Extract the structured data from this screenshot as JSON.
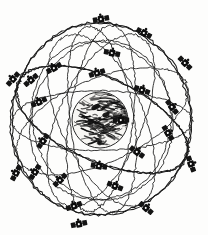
{
  "figure": {
    "kind": "line-art-diagram",
    "background_color": "#fdfdfc",
    "ink_color": "#111111",
    "width": 208,
    "height": 235
  },
  "earth": {
    "label": "Earth",
    "center_x": 100,
    "center_y": 120,
    "radius": 28,
    "fill_color": "#f7f6f3",
    "outline_color": "#2a2a2a",
    "texture": "hand-drawn scribbled continents"
  },
  "orbits": [
    {
      "name": "orbit-outer-ring",
      "cx": 101,
      "cy": 120,
      "rx": 90,
      "ry": 96,
      "rotation": 0
    },
    {
      "name": "orbit-inclined-a",
      "cx": 101,
      "cy": 120,
      "rx": 92,
      "ry": 42,
      "rotation": 24
    },
    {
      "name": "orbit-inclined-b",
      "cx": 101,
      "cy": 120,
      "rx": 92,
      "ry": 42,
      "rotation": -24
    },
    {
      "name": "orbit-inclined-c",
      "cx": 101,
      "cy": 120,
      "rx": 92,
      "ry": 42,
      "rotation": 66
    },
    {
      "name": "orbit-inclined-d",
      "cx": 101,
      "cy": 120,
      "rx": 92,
      "ry": 42,
      "rotation": -66
    },
    {
      "name": "orbit-inclined-e",
      "cx": 101,
      "cy": 120,
      "rx": 90,
      "ry": 30,
      "rotation": 0
    },
    {
      "name": "orbit-inclined-f",
      "cx": 101,
      "cy": 120,
      "rx": 32,
      "ry": 94,
      "rotation": 8
    },
    {
      "name": "orbit-inclined-g",
      "cx": 101,
      "cy": 120,
      "rx": 32,
      "ry": 94,
      "rotation": -8
    },
    {
      "name": "orbit-inner-ellipse-a",
      "cx": 101,
      "cy": 120,
      "rx": 70,
      "ry": 80,
      "rotation": 14
    },
    {
      "name": "orbit-inner-ellipse-b",
      "cx": 101,
      "cy": 120,
      "rx": 70,
      "ry": 80,
      "rotation": -14
    }
  ],
  "satellites": [
    {
      "id": "sat-01",
      "x": 101,
      "y": 19,
      "rotation": -10
    },
    {
      "id": "sat-02",
      "x": 144,
      "y": 33,
      "rotation": 28
    },
    {
      "id": "sat-03",
      "x": 112,
      "y": 53,
      "rotation": 12
    },
    {
      "id": "sat-04",
      "x": 185,
      "y": 63,
      "rotation": 45
    },
    {
      "id": "sat-05",
      "x": 142,
      "y": 90,
      "rotation": 20
    },
    {
      "id": "sat-06",
      "x": 97,
      "y": 73,
      "rotation": -18
    },
    {
      "id": "sat-07",
      "x": 54,
      "y": 68,
      "rotation": -30
    },
    {
      "id": "sat-08",
      "x": 13,
      "y": 79,
      "rotation": -48
    },
    {
      "id": "sat-09",
      "x": 31,
      "y": 80,
      "rotation": -40
    },
    {
      "id": "sat-10",
      "x": 39,
      "y": 102,
      "rotation": -25
    },
    {
      "id": "sat-11",
      "x": 172,
      "y": 107,
      "rotation": 52
    },
    {
      "id": "sat-12",
      "x": 168,
      "y": 133,
      "rotation": 58
    },
    {
      "id": "sat-13",
      "x": 43,
      "y": 141,
      "rotation": -55
    },
    {
      "id": "sat-14",
      "x": 137,
      "y": 152,
      "rotation": 36
    },
    {
      "id": "sat-15",
      "x": 99,
      "y": 166,
      "rotation": 8
    },
    {
      "id": "sat-16",
      "x": 191,
      "y": 164,
      "rotation": 70
    },
    {
      "id": "sat-17",
      "x": 16,
      "y": 173,
      "rotation": -62
    },
    {
      "id": "sat-18",
      "x": 35,
      "y": 172,
      "rotation": -58
    },
    {
      "id": "sat-19",
      "x": 60,
      "y": 180,
      "rotation": -44
    },
    {
      "id": "sat-20",
      "x": 115,
      "y": 186,
      "rotation": 22
    },
    {
      "id": "sat-21",
      "x": 146,
      "y": 208,
      "rotation": 40
    },
    {
      "id": "sat-22",
      "x": 79,
      "y": 224,
      "rotation": -12
    },
    {
      "id": "sat-23",
      "x": 121,
      "y": 120,
      "rotation": 0
    },
    {
      "id": "sat-24",
      "x": 74,
      "y": 206,
      "rotation": -20
    }
  ]
}
